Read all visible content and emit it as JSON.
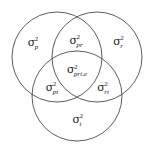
{
  "figure": {
    "name": "three-circle-venn-variance-components",
    "background_color": "#ffffff",
    "stroke_color": "#4a4a4a",
    "text_color": "#1c1c1c",
    "width": 154,
    "height": 147
  },
  "circles": [
    {
      "id": "person",
      "name": "circle-person",
      "cx": 57,
      "cy": 57,
      "r": 45
    },
    {
      "id": "rater",
      "name": "circle-rater",
      "cx": 97,
      "cy": 57,
      "r": 45
    },
    {
      "id": "time",
      "name": "circle-time",
      "cx": 77,
      "cy": 96,
      "r": 45
    }
  ],
  "labels": {
    "person": {
      "symbol": "σ",
      "exponent": "2",
      "subscript": "p"
    },
    "person_rater": {
      "symbol": "σ",
      "exponent": "2",
      "subscript": "pr"
    },
    "rater": {
      "symbol": "σ",
      "exponent": "2",
      "subscript": "r"
    },
    "person_rater_time": {
      "symbol": "σ",
      "exponent": "2",
      "subscript": "prt,e"
    },
    "person_time": {
      "symbol": "σ",
      "exponent": "2",
      "subscript": "pt"
    },
    "rater_time": {
      "symbol": "σ",
      "exponent": "2",
      "subscript": "rt"
    },
    "time": {
      "symbol": "σ",
      "exponent": "2",
      "subscript": "t"
    }
  }
}
